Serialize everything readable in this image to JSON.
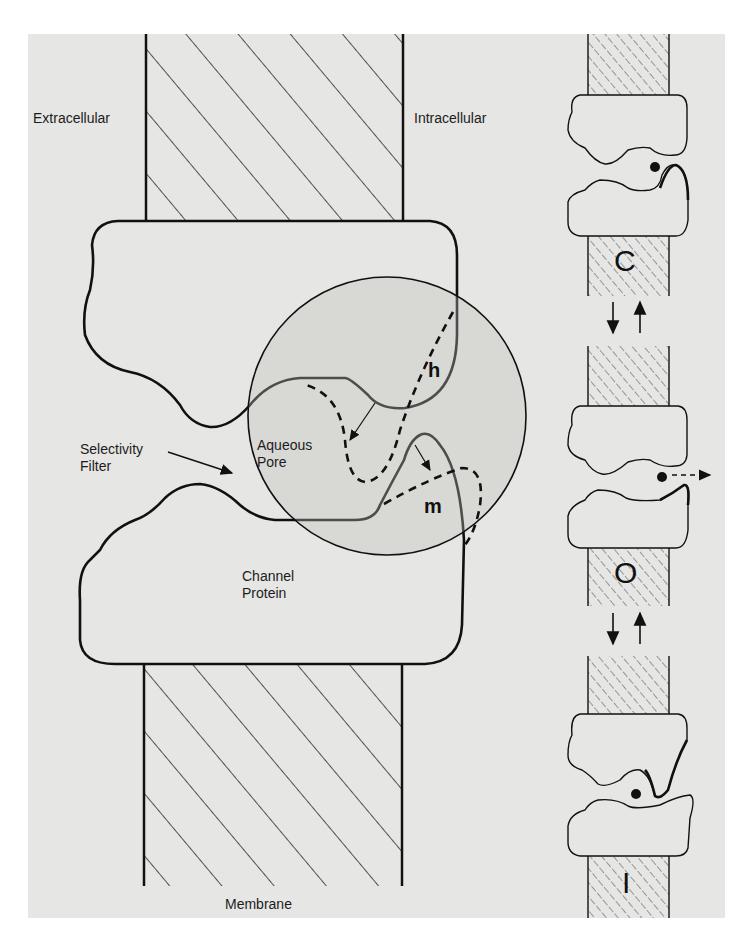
{
  "figure": {
    "type": "ion channel gating diagram",
    "main_diagram": {
      "labels": {
        "extracellular": "Extracellular",
        "intracellular": "Intracellular",
        "selectivity_filter": "Selectivity\nFilter",
        "aqueous_pore": "Aqueous\nPore",
        "channel_protein": "Channel\nProtein",
        "membrane": "Membrane"
      },
      "gates": {
        "h": "h",
        "m": "m"
      }
    },
    "state_panel": {
      "states": [
        {
          "id": "closed",
          "label": "C"
        },
        {
          "id": "open",
          "label": "O"
        },
        {
          "id": "inactivated",
          "label": "I"
        }
      ],
      "transitions": [
        "C ⇄ O",
        "O ⇄ I"
      ]
    },
    "colors": {
      "background": "#e6e6e4",
      "page": "#ffffff",
      "stroke": "#111111",
      "pore_circle_fill": "#d6d6d4"
    }
  }
}
